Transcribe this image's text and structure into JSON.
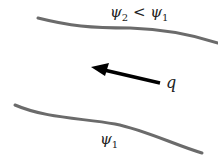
{
  "diagram": {
    "upper_streamline": {
      "label_psi": "ψ",
      "label_sub": "2",
      "relation": " < ",
      "label_psi2": "ψ",
      "label_sub2": "1"
    },
    "lower_streamline": {
      "label_psi": "ψ",
      "label_sub": "1"
    },
    "flow_vector": {
      "label": "q"
    },
    "colors": {
      "streamline": "#6b6b6b",
      "arrow": "#000000",
      "text": "#222222"
    }
  }
}
